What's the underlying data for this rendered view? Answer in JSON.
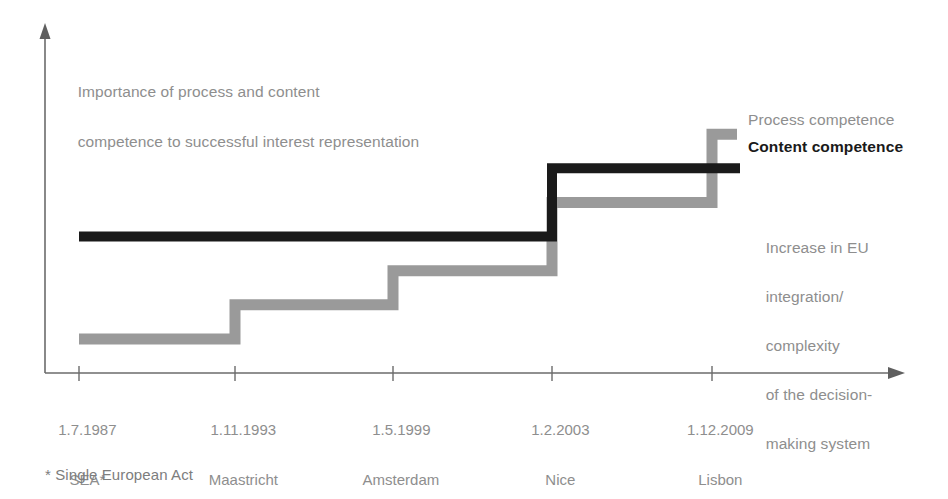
{
  "chart_data": {
    "type": "line",
    "subtype": "step",
    "title": "",
    "ylabel": "Importance of process and content\ncompetence to successful interest representation",
    "xlabel": "",
    "grid": false,
    "legend_position": "right-inline",
    "annotation": "Increase in EU\nintegration/\ncomplexity\nof the decision-\nmaking system",
    "footnote": "* Single European Act",
    "categories": [
      "1.7.1987",
      "1.11.1993",
      "1.5.1999",
      "1.2.2003",
      "1.12.2009"
    ],
    "category_sublabels": [
      "SEA*",
      "Maastricht",
      "Amsterdam",
      "Nice",
      "Lisbon"
    ],
    "series": [
      {
        "name": "Process competence",
        "color": "#9a9a9a",
        "values": [
          1,
          2,
          3,
          5,
          7
        ]
      },
      {
        "name": "Content competence",
        "color": "#1a1a1a",
        "values": [
          4,
          4,
          4,
          6,
          6
        ]
      }
    ],
    "ylim": [
      0,
      8
    ],
    "axis_color": "#6b6b6b"
  },
  "axis": {
    "y_caption_line1": "Importance of process and content",
    "y_caption_line2": "competence to successful interest representation"
  },
  "legend": {
    "process_label": "Process competence",
    "content_label": "Content competence"
  },
  "annotation": {
    "line1": "Increase in EU",
    "line2": "integration/",
    "line3": "complexity",
    "line4": "of the decision-",
    "line5": "making system"
  },
  "ticks": [
    {
      "date": "1.7.1987",
      "place": "SEA*"
    },
    {
      "date": "1.11.1993",
      "place": "Maastricht"
    },
    {
      "date": "1.5.1999",
      "place": "Amsterdam"
    },
    {
      "date": "1.2.2003",
      "place": "Nice"
    },
    {
      "date": "1.12.2009",
      "place": "Lisbon"
    }
  ],
  "footnote": {
    "text": "* Single European Act"
  },
  "colors": {
    "process": "#9a9a9a",
    "content": "#1a1a1a",
    "axis": "#6b6b6b",
    "text": "#8e8e8e"
  }
}
